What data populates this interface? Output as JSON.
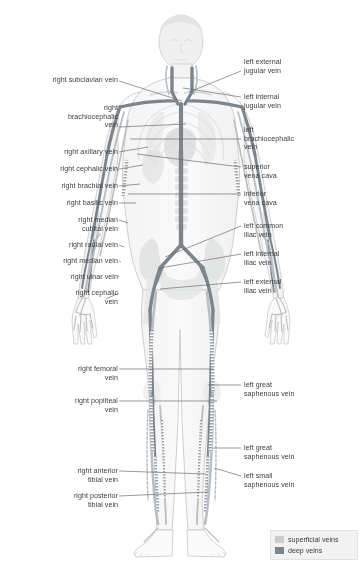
{
  "diagram": {
    "colors": {
      "superficial": "#c9cdd0",
      "deep": "#7d858c",
      "outline": "#b9bdc0",
      "skin": "#efefef",
      "bone": "#e2e4e3",
      "organ": "#dcdcdc",
      "leader": "#6e6e6e",
      "text": "#3b3b3b",
      "background": "#ffffff",
      "legend_bg": "#f2f2f2"
    }
  },
  "labels_left": [
    {
      "name": "right-subclavian-vein",
      "text": "right subclavian vein",
      "x": 8,
      "y": 76,
      "w": 110,
      "lx": 119,
      "ly": 81,
      "tx": 182,
      "ty": 101
    },
    {
      "name": "right-brachiocephalic-vein",
      "text": "right\nbrachiocephalic\nvein",
      "x": 8,
      "y": 104,
      "w": 110,
      "lx": 119,
      "ly": 127,
      "tx": 186,
      "ty": 124
    },
    {
      "name": "right-axillary-vein",
      "text": "right axillary vein",
      "x": 8,
      "y": 148,
      "w": 110,
      "lx": 119,
      "ly": 152,
      "tx": 148,
      "ty": 147
    },
    {
      "name": "right-cephalic-vein-upper",
      "text": "right cephalic vein",
      "x": 8,
      "y": 165,
      "w": 110,
      "lx": 119,
      "ly": 169,
      "tx": 143,
      "ty": 165
    },
    {
      "name": "right-brachial-vein",
      "text": "right brachial vein",
      "x": 8,
      "y": 182,
      "w": 110,
      "lx": 119,
      "ly": 186,
      "tx": 140,
      "ty": 184
    },
    {
      "name": "right-basilic-vein",
      "text": "right basilic vein",
      "x": 8,
      "y": 199,
      "w": 110,
      "lx": 119,
      "ly": 203,
      "tx": 136,
      "ty": 203
    },
    {
      "name": "right-median-cubital-vein",
      "text": "right median\ncubital vein",
      "x": 8,
      "y": 216,
      "w": 110,
      "lx": 119,
      "ly": 220,
      "tx": 128,
      "ty": 223
    },
    {
      "name": "right-radial-vein",
      "text": "right radial vein",
      "x": 8,
      "y": 241,
      "w": 110,
      "lx": 119,
      "ly": 245,
      "tx": 124,
      "ty": 247
    },
    {
      "name": "right-median-vein",
      "text": "right median vein",
      "x": 8,
      "y": 257,
      "w": 110,
      "lx": 119,
      "ly": 261,
      "tx": 121,
      "ty": 262
    },
    {
      "name": "right-ulnar-vein",
      "text": "right ulnar vein",
      "x": 8,
      "y": 273,
      "w": 110,
      "lx": 119,
      "ly": 277,
      "tx": 118,
      "ty": 276
    },
    {
      "name": "right-cephalic-vein-lower",
      "text": "right cephalic\nvein",
      "x": 8,
      "y": 289,
      "w": 110,
      "lx": 119,
      "ly": 293,
      "tx": 106,
      "ty": 299
    },
    {
      "name": "right-femoral-vein",
      "text": "right femoral\nvein",
      "x": 8,
      "y": 365,
      "w": 110,
      "lx": 119,
      "ly": 369,
      "tx": 214,
      "ty": 369
    },
    {
      "name": "right-popliteal-vein",
      "text": "right popliteal\nvein",
      "x": 8,
      "y": 397,
      "w": 110,
      "lx": 119,
      "ly": 401,
      "tx": 217,
      "ty": 401
    },
    {
      "name": "right-anterior-tibial-vein",
      "text": "right anterior\ntibial vein",
      "x": 8,
      "y": 467,
      "w": 110,
      "lx": 119,
      "ly": 471,
      "tx": 206,
      "ty": 474
    },
    {
      "name": "right-posterior-tibial-vein",
      "text": "right posterior\ntibial vein",
      "x": 8,
      "y": 492,
      "w": 110,
      "lx": 119,
      "ly": 496,
      "tx": 208,
      "ty": 492
    }
  ],
  "labels_right": [
    {
      "name": "left-external-jugular-vein",
      "text": "left external\njugular vein",
      "x": 244,
      "y": 58,
      "w": 112,
      "lx": 241,
      "ly": 71,
      "tx": 189,
      "ty": 92
    },
    {
      "name": "left-internal-jugular-vein",
      "text": "left internal\njugular vein",
      "x": 244,
      "y": 93,
      "w": 112,
      "lx": 241,
      "ly": 97,
      "tx": 183,
      "ty": 88
    },
    {
      "name": "left-brachiocephalic-vein",
      "text": "left\nbrachiocephalic\nvein",
      "x": 244,
      "y": 126,
      "w": 112,
      "lx": 241,
      "ly": 139,
      "tx": 130,
      "ty": 139
    },
    {
      "name": "superior-vena-cava",
      "text": "superior\nvena cava",
      "x": 244,
      "y": 163,
      "w": 112,
      "lx": 241,
      "ly": 167,
      "tx": 137,
      "ty": 154
    },
    {
      "name": "inferior-vena-cava",
      "text": "inferior\nvena cava",
      "x": 244,
      "y": 190,
      "w": 112,
      "lx": 241,
      "ly": 194,
      "tx": 128,
      "ty": 194
    },
    {
      "name": "left-common-iliac-vein",
      "text": "left common\niliac vein",
      "x": 244,
      "y": 222,
      "w": 112,
      "lx": 241,
      "ly": 226,
      "tx": 165,
      "ty": 257
    },
    {
      "name": "left-internal-iliac-vein",
      "text": "left internal\niliac vein",
      "x": 244,
      "y": 250,
      "w": 112,
      "lx": 241,
      "ly": 254,
      "tx": 160,
      "ty": 268
    },
    {
      "name": "left-external-iliac-vein",
      "text": "left external\niliac vein",
      "x": 244,
      "y": 278,
      "w": 112,
      "lx": 241,
      "ly": 282,
      "tx": 160,
      "ty": 289
    },
    {
      "name": "left-great-saphenous-vein-upper",
      "text": "left great\nsaphenous vein",
      "x": 244,
      "y": 381,
      "w": 112,
      "lx": 241,
      "ly": 385,
      "tx": 208,
      "ty": 385
    },
    {
      "name": "left-great-saphenous-vein-lower",
      "text": "left great\nsaphenous vein",
      "x": 244,
      "y": 444,
      "w": 112,
      "lx": 241,
      "ly": 448,
      "tx": 213,
      "ty": 448
    },
    {
      "name": "left-small-saphenous-vein",
      "text": "left small\nsaphenous vein",
      "x": 244,
      "y": 472,
      "w": 112,
      "lx": 241,
      "ly": 476,
      "tx": 214,
      "ty": 468
    }
  ],
  "legend": {
    "items": [
      {
        "name": "legend-superficial",
        "label": "superficial veins",
        "color": "#c9cdd0"
      },
      {
        "name": "legend-deep",
        "label": "deep veins",
        "color": "#7d858c"
      }
    ]
  }
}
